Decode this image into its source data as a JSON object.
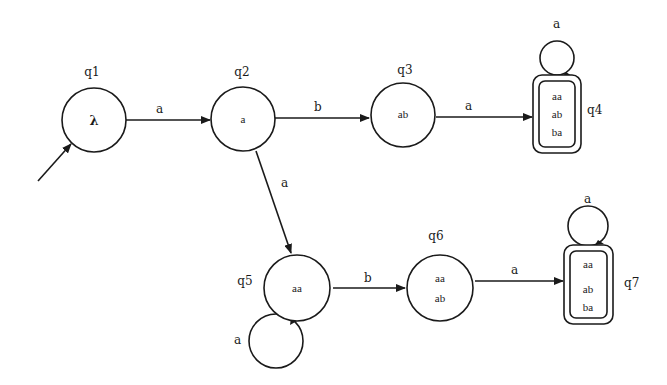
{
  "diagram": {
    "type": "finite-automaton",
    "start_state": "q1",
    "states": [
      {
        "id": "q1",
        "label": "q1",
        "contents": [
          "λ"
        ],
        "accepting": false
      },
      {
        "id": "q2",
        "label": "q2",
        "contents": [
          "a"
        ],
        "accepting": false
      },
      {
        "id": "q3",
        "label": "q3",
        "contents": [
          "ab"
        ],
        "accepting": false
      },
      {
        "id": "q4",
        "label": "q4",
        "contents": [
          "aa",
          "ab",
          "ba"
        ],
        "accepting": true
      },
      {
        "id": "q5",
        "label": "q5",
        "contents": [
          "aa"
        ],
        "accepting": false
      },
      {
        "id": "q6",
        "label": "q6",
        "contents": [
          "aa",
          "ab"
        ],
        "accepting": false
      },
      {
        "id": "q7",
        "label": "q7",
        "contents": [
          "aa",
          "ab",
          "ba"
        ],
        "accepting": true
      }
    ],
    "transitions": [
      {
        "from": "q1",
        "to": "q2",
        "label": "a"
      },
      {
        "from": "q2",
        "to": "q3",
        "label": "b"
      },
      {
        "from": "q3",
        "to": "q4",
        "label": "a"
      },
      {
        "from": "q4",
        "to": "q4",
        "label": "a"
      },
      {
        "from": "q2",
        "to": "q5",
        "label": "a"
      },
      {
        "from": "q5",
        "to": "q5",
        "label": "a"
      },
      {
        "from": "q5",
        "to": "q6",
        "label": "b"
      },
      {
        "from": "q6",
        "to": "q7",
        "label": "a"
      },
      {
        "from": "q7",
        "to": "q7",
        "label": "a"
      }
    ]
  }
}
